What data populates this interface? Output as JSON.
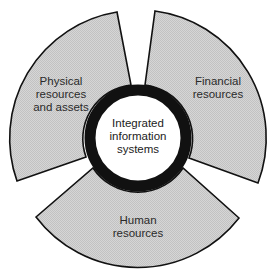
{
  "diagram": {
    "type": "segmented ring",
    "center": {
      "label_lines": [
        "Integrated",
        "information",
        "systems"
      ]
    },
    "segments": [
      {
        "id": "physical",
        "label_lines": [
          "Physical",
          "resources",
          "and assets"
        ]
      },
      {
        "id": "financial",
        "label_lines": [
          "Financial",
          "resources"
        ]
      },
      {
        "id": "human",
        "label_lines": [
          "Human",
          "resources"
        ]
      }
    ],
    "colors": {
      "segment_fill": "#cfcfcf",
      "segment_stroke": "#111111",
      "hub_ring": "#111111",
      "hub_fill": "#ffffff",
      "background": "#ffffff",
      "text": "#2a2a2a"
    }
  }
}
